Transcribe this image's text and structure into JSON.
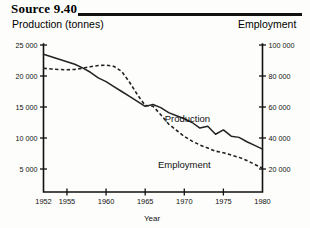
{
  "header": {
    "source_label": "Source 9.40",
    "left_axis_title": "Production (tonnes)",
    "right_axis_title": "Employment"
  },
  "chart_data": {
    "type": "line",
    "title": "Source 9.40",
    "xlabel": "Year",
    "ylabel": "Production (tonnes)",
    "y2label": "Employment",
    "grid": false,
    "legend_position": "inline-annotations",
    "xlim": [
      1952,
      1980
    ],
    "ylim": [
      0,
      25000
    ],
    "y2lim": [
      0,
      100000
    ],
    "xticks": [
      1952,
      1955,
      1960,
      1965,
      1970,
      1975,
      1980
    ],
    "xticklabels": [
      "1952",
      "1955",
      "1960",
      "1965",
      "1970",
      "1975",
      "1980"
    ],
    "yticks": [
      5000,
      10000,
      15000,
      20000,
      25000
    ],
    "yticklabels": [
      "5 000",
      "10 000",
      "15 000",
      "20 000",
      "25 000"
    ],
    "y2ticks": [
      20000,
      40000,
      60000,
      80000,
      100000
    ],
    "y2ticklabels": [
      "20 000",
      "40 000",
      "60 000",
      "80 000",
      "100 000"
    ],
    "annotations": [
      {
        "text": "Production",
        "x": 1970.4,
        "y": 12600
      },
      {
        "text": "Employment",
        "x": 1970.0,
        "y": 5200
      }
    ],
    "series": [
      {
        "name": "Production",
        "axis": "left",
        "style": "solid",
        "x": [
          1952,
          1953,
          1954,
          1955,
          1956,
          1957,
          1958,
          1959,
          1960,
          1961,
          1962,
          1963,
          1964,
          1965,
          1966,
          1967,
          1968,
          1969,
          1970,
          1971,
          1972,
          1973,
          1974,
          1975,
          1976,
          1977,
          1978,
          1979,
          1980
        ],
        "values": [
          23500,
          23100,
          22700,
          22300,
          21900,
          21300,
          20600,
          19700,
          19100,
          18300,
          17500,
          16700,
          15900,
          15100,
          15400,
          14900,
          14100,
          13600,
          13100,
          12500,
          11600,
          11900,
          10600,
          11300,
          10300,
          10100,
          9400,
          8800,
          8200
        ]
      },
      {
        "name": "Employment",
        "axis": "right",
        "style": "dashed",
        "x": [
          1952,
          1953,
          1954,
          1955,
          1956,
          1957,
          1958,
          1959,
          1960,
          1961,
          1962,
          1963,
          1964,
          1965,
          1966,
          1967,
          1968,
          1969,
          1970,
          1971,
          1972,
          1973,
          1974,
          1975,
          1976,
          1977,
          1978,
          1979,
          1980
        ],
        "values": [
          85000,
          84500,
          84200,
          84000,
          84300,
          85000,
          86000,
          86800,
          87000,
          86200,
          83000,
          76000,
          68000,
          61000,
          60500,
          55000,
          49000,
          45000,
          41000,
          38000,
          35500,
          33500,
          31500,
          30500,
          29000,
          27500,
          25500,
          23000,
          20500
        ]
      }
    ]
  }
}
